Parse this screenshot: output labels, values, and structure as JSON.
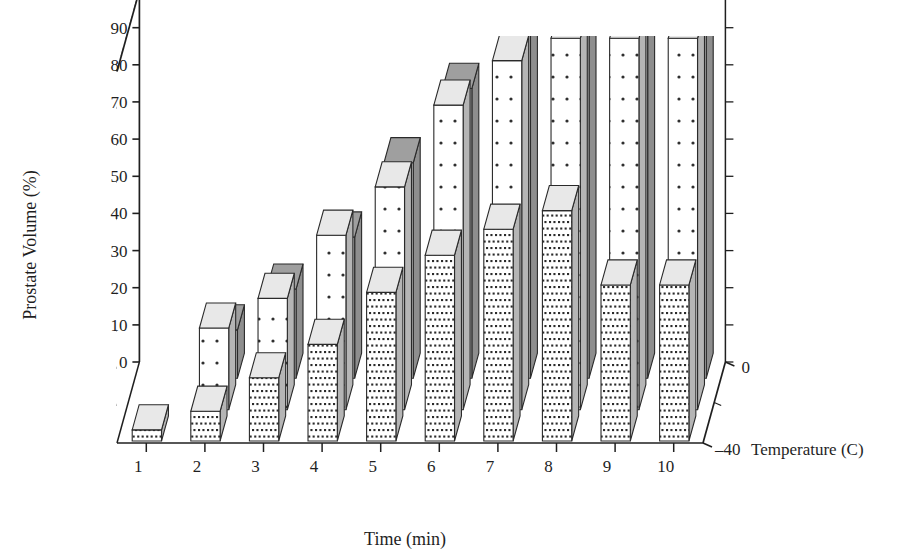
{
  "figure": {
    "kind": "3d-bar-chart",
    "background": "#ffffff",
    "ink": "#1f1f1f"
  },
  "axes": {
    "y_label": "Prostate Volume (%)",
    "x_label": "Time (min)",
    "z_label": "Temperature (C)",
    "y_ticks": [
      "0",
      "10",
      "20",
      "30",
      "40",
      "50",
      "60",
      "70",
      "80",
      "90",
      "100"
    ],
    "x_ticks": [
      "1",
      "2",
      "3",
      "4",
      "5",
      "6",
      "7",
      "8",
      "9",
      "10"
    ],
    "z_ticks": [
      "0",
      "-40"
    ]
  },
  "series_style": {
    "back_fill": "#b9b9b9",
    "back_side": "#8e8e8e",
    "back_top": "#9f9f9f",
    "mid_fill": "#ffffff",
    "mid_side": "#b5b5b5",
    "mid_top": "#e8e8e8",
    "front_fill": "#ffffff",
    "front_side": "#b5b5b5",
    "front_top": "#e8e8e8",
    "stroke": "#2a2a2a"
  },
  "chart_data": {
    "type": "bar",
    "title": "",
    "xlabel": "Time (min)",
    "ylabel": "Prostate Volume (%)",
    "zlabel": "Temperature (C)",
    "ylim": [
      0,
      100
    ],
    "grid": true,
    "legend": "none",
    "categories": [
      "1",
      "2",
      "3",
      "4",
      "5",
      "6",
      "7",
      "8",
      "9",
      "10"
    ],
    "depth_categories": [
      "0",
      "-40"
    ],
    "series": [
      {
        "name": "back",
        "pattern": "solid-gray",
        "values": [
          0,
          13,
          24,
          38,
          58,
          78,
          100,
          100,
          100,
          100
        ]
      },
      {
        "name": "middle",
        "pattern": "sparse-dots",
        "values": [
          0,
          22,
          30,
          47,
          60,
          82,
          94,
          100,
          100,
          100
        ]
      },
      {
        "name": "front",
        "pattern": "dense-dots",
        "values": [
          3,
          8,
          17,
          26,
          40,
          50,
          57,
          62,
          42,
          42
        ]
      }
    ]
  }
}
